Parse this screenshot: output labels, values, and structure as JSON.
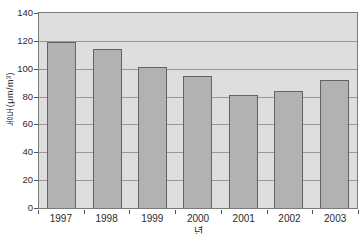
{
  "chart_data": {
    "type": "bar",
    "title": "",
    "categories": [
      "1997",
      "1998",
      "1999",
      "2000",
      "2001",
      "2002",
      "2003"
    ],
    "values": [
      119,
      114,
      101,
      95,
      81,
      84,
      92
    ],
    "xlabel": "년",
    "ylabel": "농도(μm/m³)",
    "ylim": [
      0,
      140
    ],
    "yticks": [
      0,
      20,
      40,
      60,
      80,
      100,
      120,
      140
    ],
    "grid": true,
    "legend": false,
    "colors": {
      "page_bg": "#ffffff",
      "plot_bg": "#dedede",
      "bar_fill": "#b2b2b2",
      "bar_border": "#636363",
      "gridline": "#989898",
      "frame": "#7a7a7a",
      "text": "#2b2b2b"
    }
  }
}
